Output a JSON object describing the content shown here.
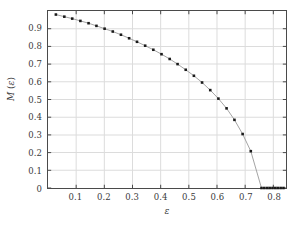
{
  "chart_data": {
    "type": "line",
    "title": "",
    "xlabel": "ε",
    "ylabel": "M (ε)",
    "xlim": [
      0,
      0.845
    ],
    "ylim": [
      0,
      1.0
    ],
    "grid": true,
    "legend": null,
    "marker": "square",
    "marker_color": "#1a1a1a",
    "line_color": "#9a9a9a",
    "grid_color": "#dcdcdc",
    "axis_color": "#4a4a4a",
    "xticks": [
      0.1,
      0.2,
      0.3,
      0.4,
      0.5,
      0.6,
      0.7,
      0.8
    ],
    "xtick_labels": [
      "0.1",
      "0.2",
      "0.3",
      "0.4",
      "0.5",
      "0.6",
      "0.7",
      "0.8"
    ],
    "yticks": [
      0,
      0.1,
      0.2,
      0.3,
      0.4,
      0.5,
      0.6,
      0.7,
      0.8,
      0.9
    ],
    "ytick_labels": [
      "0",
      "0.1",
      "0.2",
      "0.3",
      "0.4",
      "0.5",
      "0.6",
      "0.7",
      "0.8",
      "0.9"
    ],
    "series": [
      {
        "name": "M(ε)",
        "x": [
          0.028,
          0.058,
          0.086,
          0.115,
          0.144,
          0.172,
          0.201,
          0.23,
          0.259,
          0.288,
          0.316,
          0.345,
          0.374,
          0.403,
          0.432,
          0.46,
          0.489,
          0.518,
          0.547,
          0.576,
          0.605,
          0.634,
          0.662,
          0.691,
          0.72,
          0.758,
          0.768,
          0.778,
          0.787,
          0.797,
          0.807,
          0.816,
          0.826,
          0.836
        ],
        "y": [
          0.98,
          0.968,
          0.957,
          0.944,
          0.931,
          0.916,
          0.9,
          0.884,
          0.866,
          0.846,
          0.826,
          0.804,
          0.781,
          0.756,
          0.729,
          0.7,
          0.668,
          0.634,
          0.596,
          0.553,
          0.505,
          0.45,
          0.385,
          0.305,
          0.208,
          0.0,
          0.0,
          0.0,
          0.0,
          0.0,
          0.0,
          0.0,
          0.0,
          0.0
        ]
      }
    ],
    "annotations": []
  }
}
